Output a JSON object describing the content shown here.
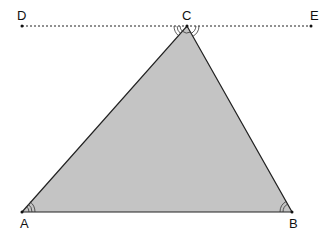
{
  "diagram": {
    "type": "triangle-with-parallel-line",
    "fill_color": "#c4c4c4",
    "stroke_color": "#222222",
    "points": {
      "A": {
        "label": "A",
        "x": 22,
        "y": 212
      },
      "B": {
        "label": "B",
        "x": 292,
        "y": 212
      },
      "C": {
        "label": "C",
        "x": 187,
        "y": 26
      },
      "D": {
        "label": "D",
        "x": 22,
        "y": 26
      },
      "E": {
        "label": "E",
        "x": 311,
        "y": 26
      }
    },
    "segments": [
      "AB",
      "BC",
      "CA"
    ],
    "dashed_line": "DE",
    "angle_marks": {
      "A": {
        "arcs": 3
      },
      "B": {
        "arcs": 2
      },
      "C_left": {
        "arcs": 3
      },
      "C_mid": {
        "arcs": 1
      },
      "C_right": {
        "arcs": 2
      }
    }
  }
}
